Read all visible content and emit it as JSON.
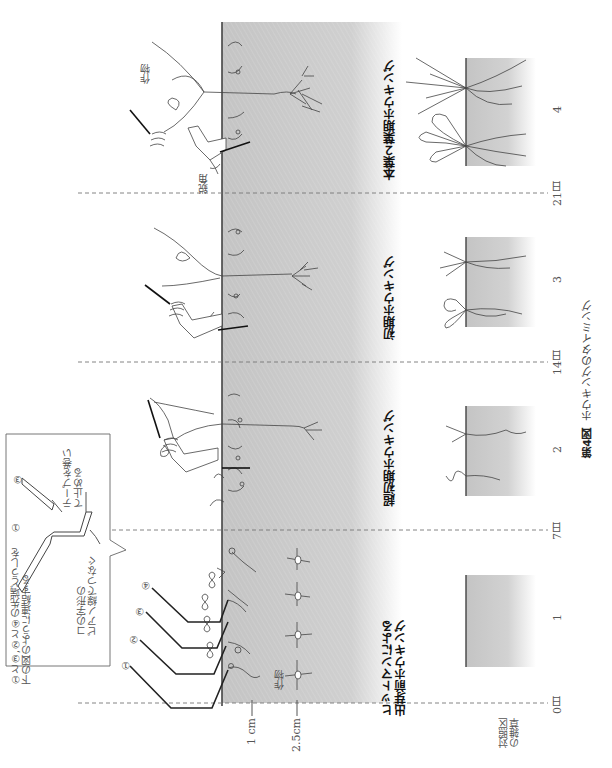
{
  "figure": {
    "caption_label": "第4図",
    "caption_title": "ホウキングのタイミング",
    "orientation": "rotated 90° counter-clockwise"
  },
  "timeline": {
    "days": [
      {
        "label": "0日",
        "y": 703
      },
      {
        "label": "7日",
        "y": 530
      },
      {
        "label": "14日",
        "y": 362
      },
      {
        "label": "21日",
        "y": 193
      }
    ]
  },
  "depth_scale": {
    "marks": [
      {
        "label": "1 cm",
        "x": 252
      },
      {
        "label": "2.5cm",
        "x": 297
      }
    ]
  },
  "stages": [
    {
      "id": 1,
      "number": "1",
      "title_line1": "ヒットマンによる",
      "title_line2": "出芽前ホウキング"
    },
    {
      "id": 2,
      "number": "2",
      "title": "超初期ホウキング"
    },
    {
      "id": 3,
      "number": "3",
      "title": "初期ホウキング"
    },
    {
      "id": 4,
      "number": "4",
      "title": "本葉２葉期ホウキング"
    }
  ],
  "labels": {
    "crop_stage1": "作物",
    "crop_stage4": "作物",
    "acute_angle": "鋭角",
    "control_weeds_line1": "対照区",
    "control_weeds_line2": "の雑草"
  },
  "callout": {
    "instruction_line1": "①と③,②と④の先端どうしを",
    "instruction_line2": "下の図のように連結する",
    "tape_line1": "テープを巻い",
    "tape_line2": "て止める",
    "piano_line1": "コの字形の",
    "piano_line2": "ピアノ線でつなぐ",
    "marker_1": "①",
    "marker_3": "③"
  },
  "tines": [
    "①",
    "②",
    "③",
    "④"
  ],
  "colors": {
    "soil": "#c8c8c8",
    "soil_light": "#e4e4e4",
    "line": "#333333",
    "dash": "#777777"
  }
}
